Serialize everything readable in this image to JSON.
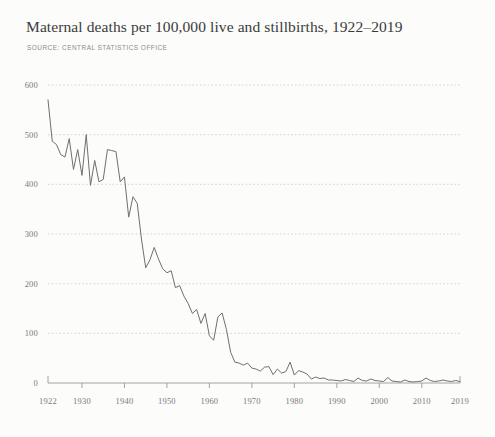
{
  "header": {
    "title": "Maternal deaths per 100,000 live and stillbirths, 1922–2019",
    "source": "SOURCE: CENTRAL STATISTICS OFFICE"
  },
  "colors": {
    "background": "#fcfcfb",
    "title": "#3b3b3b",
    "source": "#8c8c8c",
    "line": "#6f6f6f",
    "grid": "#c9c9c9",
    "axis": "#9a9a9a",
    "tick_label": "#7a7a7a"
  },
  "chart_data": {
    "type": "line",
    "title": "Maternal deaths per 100,000 live and stillbirths, 1922–2019",
    "subtitle": "SOURCE: CENTRAL STATISTICS OFFICE",
    "xlabel": "",
    "ylabel": "",
    "xlim": [
      1922,
      2019
    ],
    "ylim": [
      0,
      600
    ],
    "grid": "horizontal-dotted",
    "legend": "none",
    "yticks": [
      0,
      100,
      200,
      300,
      400,
      500,
      600
    ],
    "ytick_labels": [
      "0",
      "100",
      "200",
      "300",
      "400",
      "500",
      "600"
    ],
    "xticks": [
      1922,
      1930,
      1940,
      1950,
      1960,
      1970,
      1980,
      1990,
      2000,
      2010,
      2019
    ],
    "xtick_labels": [
      "1922",
      "1930",
      "1940",
      "1950",
      "1960",
      "1970",
      "1980",
      "1990",
      "2000",
      "2010",
      "2019"
    ],
    "series": [
      {
        "name": "Maternal deaths per 100,000 live and stillbirths",
        "x": [
          1922,
          1923,
          1924,
          1925,
          1926,
          1927,
          1928,
          1929,
          1930,
          1931,
          1932,
          1933,
          1934,
          1935,
          1936,
          1937,
          1938,
          1939,
          1940,
          1941,
          1942,
          1943,
          1944,
          1945,
          1946,
          1947,
          1948,
          1949,
          1950,
          1951,
          1952,
          1953,
          1954,
          1955,
          1956,
          1957,
          1958,
          1959,
          1960,
          1961,
          1962,
          1963,
          1964,
          1965,
          1966,
          1967,
          1968,
          1969,
          1970,
          1971,
          1972,
          1973,
          1974,
          1975,
          1976,
          1977,
          1978,
          1979,
          1980,
          1981,
          1982,
          1983,
          1984,
          1985,
          1986,
          1987,
          1988,
          1989,
          1990,
          1991,
          1992,
          1993,
          1994,
          1995,
          1996,
          1997,
          1998,
          1999,
          2000,
          2001,
          2002,
          2003,
          2004,
          2005,
          2006,
          2007,
          2008,
          2009,
          2010,
          2011,
          2012,
          2013,
          2014,
          2015,
          2016,
          2017,
          2018,
          2019
        ],
        "values": [
          570,
          487,
          480,
          460,
          455,
          492,
          430,
          470,
          418,
          500,
          398,
          448,
          405,
          410,
          470,
          468,
          466,
          405,
          415,
          334,
          375,
          362,
          290,
          232,
          248,
          273,
          250,
          230,
          222,
          226,
          192,
          196,
          175,
          160,
          140,
          148,
          120,
          140,
          95,
          86,
          133,
          141,
          108,
          62,
          42,
          40,
          36,
          40,
          30,
          28,
          24,
          32,
          33,
          17,
          28,
          20,
          23,
          42,
          16,
          25,
          22,
          18,
          8,
          12,
          9,
          10,
          6,
          6,
          5,
          4,
          7,
          5,
          3,
          10,
          5,
          4,
          8,
          5,
          4,
          3,
          11,
          4,
          3,
          2,
          6,
          3,
          2,
          3,
          4,
          10,
          5,
          3,
          4,
          6,
          4,
          3,
          5,
          3
        ]
      }
    ]
  }
}
